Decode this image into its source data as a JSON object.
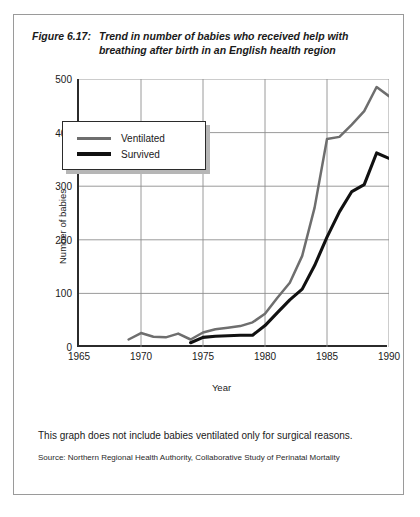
{
  "figure": {
    "label": "Figure 6.17:",
    "caption": "Trend in number of babies who received help with breathing after birth in an English health region",
    "note": "This graph does not include babies ventilated only for surgical reasons.",
    "source": "Source: Northern Regional Health Authority, Collaborative Study of Perinatal Mortality"
  },
  "legend": {
    "position": "inside-top-left",
    "items": [
      {
        "label": "Ventilated",
        "color": "#6e6e6e"
      },
      {
        "label": "Survived",
        "color": "#111111"
      }
    ]
  },
  "colors": {
    "ventilated": "#6e6e6e",
    "survived": "#111111",
    "axis": "#2b2b2b",
    "grid": "#8e8e8e",
    "frame": "#9a9a9a",
    "shadow": "#b6b6b6"
  },
  "chart_data": {
    "type": "line",
    "title": "Trend in number of babies who received help with breathing after birth in an English health region",
    "xlabel": "Year",
    "ylabel": "Number of babies",
    "xlim": [
      1965,
      1990
    ],
    "ylim": [
      0,
      500
    ],
    "xticks": [
      1965,
      1970,
      1975,
      1980,
      1985,
      1990
    ],
    "yticks": [
      0,
      100,
      200,
      300,
      400,
      500
    ],
    "grid": true,
    "series": [
      {
        "name": "Ventilated",
        "color": "#6e6e6e",
        "x": [
          1969,
          1970,
          1971,
          1972,
          1973,
          1974,
          1975,
          1976,
          1977,
          1978,
          1979,
          1980,
          1981,
          1982,
          1983,
          1984,
          1985,
          1986,
          1987,
          1988,
          1989,
          1990
        ],
        "values": [
          14,
          26,
          19,
          18,
          25,
          14,
          27,
          33,
          36,
          39,
          46,
          62,
          92,
          120,
          170,
          260,
          388,
          392,
          415,
          440,
          485,
          468
        ]
      },
      {
        "name": "Survived",
        "color": "#111111",
        "x": [
          1974,
          1975,
          1976,
          1977,
          1978,
          1979,
          1980,
          1981,
          1982,
          1983,
          1984,
          1985,
          1986,
          1987,
          1988,
          1989,
          1990
        ],
        "values": [
          8,
          18,
          20,
          21,
          22,
          22,
          40,
          64,
          88,
          108,
          152,
          205,
          252,
          290,
          303,
          362,
          352
        ]
      }
    ]
  }
}
